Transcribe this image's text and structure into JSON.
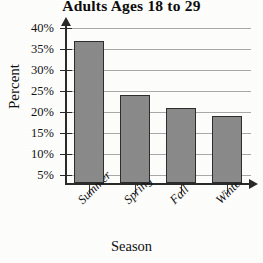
{
  "chart_data": {
    "type": "bar",
    "title": "Adults Ages 18 to 29",
    "xlabel": "Season",
    "ylabel": "Percent",
    "categories": [
      "Summer",
      "Spring",
      "Fall",
      "Winter"
    ],
    "values": [
      37,
      24,
      21,
      19
    ],
    "value_unit": "%",
    "ylim": [
      0,
      40
    ],
    "ytick_values": [
      40,
      35,
      30,
      25,
      20,
      15,
      10,
      5
    ],
    "ytick_labels": [
      "40%",
      "35%",
      "30%",
      "25%",
      "20%",
      "15%",
      "10%",
      "5%"
    ],
    "grid": true,
    "grid_axis": "y",
    "legend": false,
    "legend_position": "none",
    "bar_color": "#8a8a8a",
    "bar_edge_color": "#2d2d2d",
    "axis_color": "#2a2a2a",
    "gridline_color": "#9a9a9a",
    "background_color": "#fdfdfc",
    "xtick_label_rotation": -45
  }
}
